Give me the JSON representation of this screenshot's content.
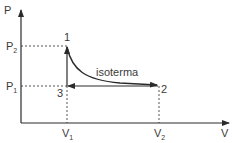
{
  "diagram": {
    "axes": {
      "y_label": "P",
      "x_label": "V"
    },
    "pressure_ticks": [
      {
        "main": "P",
        "sub": "2"
      },
      {
        "main": "P",
        "sub": "1"
      }
    ],
    "volume_ticks": [
      {
        "main": "V",
        "sub": "1"
      },
      {
        "main": "V",
        "sub": "2"
      }
    ],
    "points": [
      {
        "label": "1"
      },
      {
        "label": "2"
      },
      {
        "label": "3"
      }
    ],
    "curve_label": "isoterma",
    "colors": {
      "line": "#2a2a2a",
      "text": "#3a3a3a",
      "background": "#ffffff"
    }
  }
}
